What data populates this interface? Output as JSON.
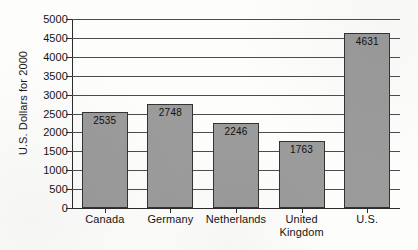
{
  "chart_data": {
    "type": "bar",
    "title": "",
    "subtitle": "",
    "xlabel": "",
    "ylabel": "U.S. Dollars for 2000",
    "categories": [
      "Canada",
      "Germany",
      "Netherlands",
      "United Kingdom",
      "U.S."
    ],
    "category_lines": [
      [
        "Canada"
      ],
      [
        "Germany"
      ],
      [
        "Netherlands"
      ],
      [
        "United",
        "Kingdom"
      ],
      [
        "U.S."
      ]
    ],
    "values": [
      2535,
      2748,
      2246,
      1763,
      4631
    ],
    "data_labels": [
      "2535",
      "2748",
      "2246",
      "1763",
      "4631"
    ],
    "ylim": [
      0,
      5000
    ],
    "ytick_step": 500,
    "ytick_labels": [
      "5000",
      "4500",
      "4000",
      "3500",
      "3000",
      "2500",
      "2000",
      "1500",
      "1000",
      "500",
      "0"
    ],
    "ytick_values": [
      5000,
      4500,
      4000,
      3500,
      3000,
      2500,
      2000,
      1500,
      1000,
      500,
      0
    ],
    "grid": true,
    "grid_orientation": "horizontal",
    "legend": false,
    "legend_position": "none",
    "bar_fill_color": "#9b9b9b",
    "bar_border_color": "#333333",
    "axis_color": "#2b2b2b",
    "gridline_color": "#4d4d4d",
    "text_color": "#141414",
    "background_color": "#fdfdfc"
  }
}
